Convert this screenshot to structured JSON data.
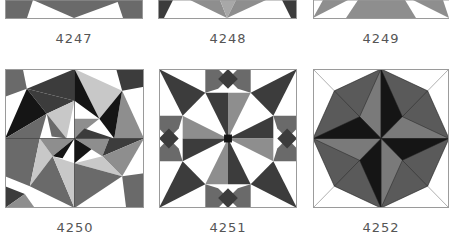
{
  "colors": {
    "white": "#ffffff",
    "light": "#c8c8c8",
    "medium": "#8e8e8e",
    "mid_dark": "#6a6a6a",
    "dark": "#3c3c3c",
    "black": "#151515",
    "outline": "#9a9a9a",
    "label_text": "#555555"
  },
  "blocks": [
    {
      "id": "4247",
      "label": "4247",
      "row": "top"
    },
    {
      "id": "4248",
      "label": "4248",
      "row": "top"
    },
    {
      "id": "4249",
      "label": "4249",
      "row": "top"
    },
    {
      "id": "4250",
      "label": "4250",
      "row": "bottom"
    },
    {
      "id": "4251",
      "label": "4251",
      "row": "bottom"
    },
    {
      "id": "4252",
      "label": "4252",
      "row": "bottom"
    }
  ]
}
